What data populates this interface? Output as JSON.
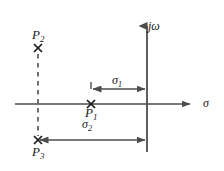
{
  "figure": {
    "type": "s-plane-pole-diagram",
    "background_color": "#ffffff",
    "line_color": "#4d4d4d",
    "text_color": "#1a1a1a"
  },
  "axes": {
    "vertical": {
      "name": "imaginary-axis",
      "label_main": "j",
      "label_sub": "ω",
      "label_full": "jω",
      "x": 147,
      "y_top": 22,
      "y_bottom": 152
    },
    "horizontal": {
      "name": "real-axis",
      "label_full": "σ",
      "y": 104,
      "x_left": 15,
      "x_right": 196
    }
  },
  "poles": [
    {
      "id": "P1",
      "label_main": "P",
      "label_sub": "1",
      "label_full": "P₁",
      "marker": "x-marker",
      "x": 91,
      "y": 104,
      "label_x": 85,
      "label_y": 106
    },
    {
      "id": "P2",
      "label_main": "P",
      "label_sub": "2",
      "label_full": "P₂",
      "marker": "x-marker",
      "x": 38,
      "y": 48,
      "label_x": 32,
      "label_y": 28
    },
    {
      "id": "P3",
      "label_main": "P",
      "label_sub": "3",
      "label_full": "P₃",
      "marker": "x-marker",
      "x": 38,
      "y": 140,
      "label_x": 32,
      "label_y": 145
    }
  ],
  "dashed_line": {
    "name": "projection-dashed-line",
    "x": 38,
    "y_top": 54,
    "y_bottom": 136
  },
  "measurements": [
    {
      "id": "sigma1",
      "label_main": "σ",
      "label_sub": "1",
      "label_full": "σ₁",
      "from_x": 91,
      "to_x": 147,
      "y": 89,
      "label_x": 112,
      "label_y": 74
    },
    {
      "id": "sigma2",
      "label_main": "σ",
      "label_sub": "2",
      "label_full": "σ₂",
      "from_x": 38,
      "to_x": 147,
      "y": 140,
      "label_x": 82,
      "label_y": 118
    }
  ],
  "tick": {
    "name": "pole-p1-tick",
    "x": 91,
    "y_top": 82,
    "y_bottom": 89
  }
}
